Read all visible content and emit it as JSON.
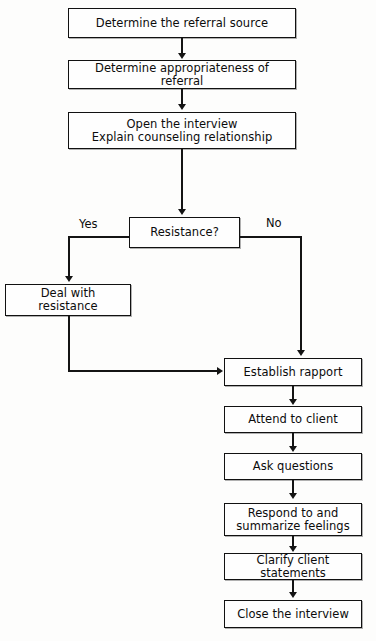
{
  "diagram": {
    "background_color": "#fdfdfc",
    "line_color": "#141414",
    "text_color": "#0c0c0c"
  },
  "nodes": [
    {
      "id": "referral_source",
      "label": "Determine the referral source",
      "line2": ""
    },
    {
      "id": "appropriateness",
      "label": "Determine appropriateness of referral",
      "line2": ""
    },
    {
      "id": "open_interview",
      "label": "Open the interview",
      "line2": "Explain counseling relationship"
    },
    {
      "id": "resistance",
      "label": "Resistance?",
      "line2": ""
    },
    {
      "id": "deal_resistance",
      "label": "Deal with resistance",
      "line2": ""
    },
    {
      "id": "establish_rapport",
      "label": "Establish rapport",
      "line2": ""
    },
    {
      "id": "attend_client",
      "label": "Attend to client",
      "line2": ""
    },
    {
      "id": "ask_questions",
      "label": "Ask questions",
      "line2": ""
    },
    {
      "id": "respond_summarize",
      "label": "Respond to and",
      "line2": "summarize feelings"
    },
    {
      "id": "clarify",
      "label": "Clarify client statements",
      "line2": ""
    },
    {
      "id": "close_interview",
      "label": "Close the interview",
      "line2": ""
    }
  ],
  "branch_labels": {
    "yes": "Yes",
    "no": "No"
  }
}
